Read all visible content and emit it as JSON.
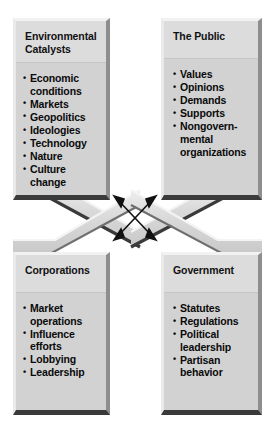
{
  "diagram": {
    "type": "four-quadrant-interaction-diagram",
    "center": {
      "connector_shape": "X",
      "arrows": [
        {
          "name": "arrow-top-left-bottom-right",
          "direction": "double-headed"
        },
        {
          "name": "arrow-top-right-bottom-left",
          "direction": "double-headed"
        }
      ]
    },
    "nodes": [
      {
        "id": "environmental-catalysts",
        "title": "Environmental Catalysts",
        "position": "top-left",
        "items": [
          "Economic conditions",
          "Markets",
          "Geopolitics",
          "Ideologies",
          "Technology",
          "Nature",
          "Culture change"
        ]
      },
      {
        "id": "the-public",
        "title": "The Public",
        "position": "top-right",
        "items": [
          "Values",
          "Opinions",
          "Demands",
          "Supports",
          "Nongovern-mental organizations"
        ]
      },
      {
        "id": "corporations",
        "title": "Corporations",
        "position": "bottom-left",
        "items": [
          "Market operations",
          "Influence efforts",
          "Lobbying",
          "Leadership"
        ]
      },
      {
        "id": "government",
        "title": "Government",
        "position": "bottom-right",
        "items": [
          "Statutes",
          "Regulations",
          "Political leadership",
          "Partisan behavior"
        ]
      }
    ]
  },
  "colors": {
    "background": "#ffffff",
    "box_face": "#d2d2d2",
    "box_title_face": "#dcdcdc",
    "bevel_light": "#f2f2f2",
    "bevel_dark": "#3a3a3a",
    "band_face": "#d8d8d8",
    "text": "#0a0a0a",
    "arrow": "#111111"
  }
}
